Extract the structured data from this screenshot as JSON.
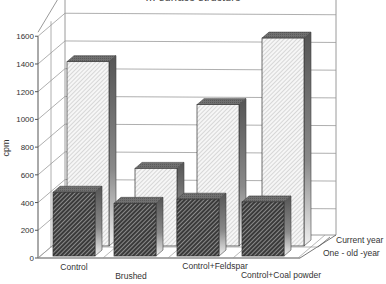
{
  "chart_data": {
    "type": "bar",
    "subtype": "3d-grouped-depth",
    "title": "… surface structure",
    "xlabel": "",
    "ylabel": "cpm",
    "ylim": [
      0,
      1600
    ],
    "yticks": [
      0,
      200,
      400,
      600,
      800,
      1000,
      1200,
      1400,
      1600
    ],
    "grid": true,
    "legend_position": "depth-axis-right",
    "categories": [
      "Control",
      "Brushed",
      "Control+Feldspar",
      "Control+Coal powder"
    ],
    "series": [
      {
        "name": "One - old -year",
        "row": "front",
        "pattern": "dense-dark-hatch",
        "values": [
          460,
          380,
          410,
          390
        ]
      },
      {
        "name": "Current year",
        "row": "back",
        "pattern": "light-hatch",
        "values": [
          1330,
          560,
          1020,
          1500
        ]
      }
    ]
  },
  "colors": {
    "axis": "#555555",
    "grid": "#9a9a9a",
    "front_hatch_bg": "#3a3a3a",
    "front_hatch_line": "#d8d8d8",
    "back_hatch_bg": "#f4f4f4",
    "back_hatch_line": "#9a9a9a",
    "top_face": "#6e6e6e",
    "side_dark": "#555555",
    "side_light": "#e8e8e8"
  }
}
